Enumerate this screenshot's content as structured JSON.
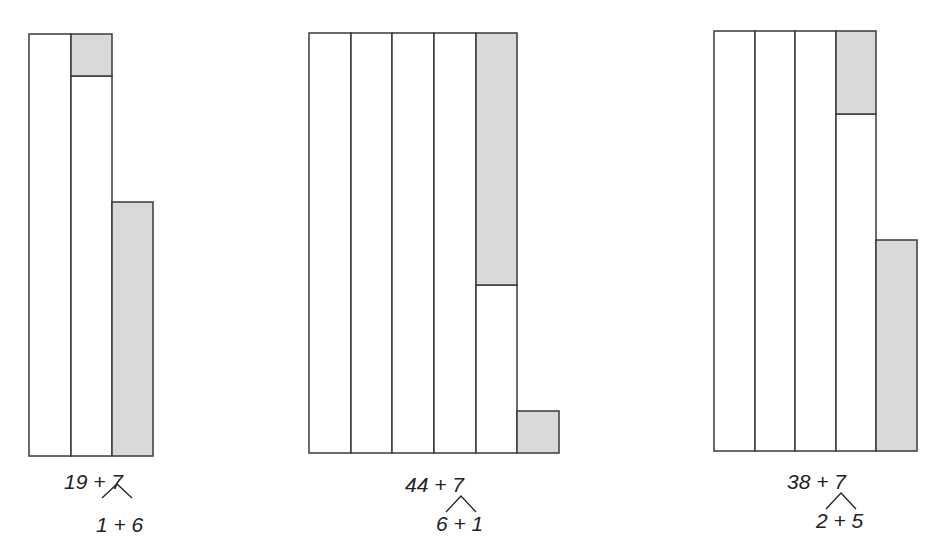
{
  "diagrams": [
    {
      "name": "nineteen-plus-seven",
      "expression": "19 + 7",
      "split": "1 + 6",
      "tens_columns": 1,
      "partial_column_units": 9,
      "added_units": 7,
      "fill_units": 1,
      "leftover_units": 6
    },
    {
      "name": "forty-four-plus-seven",
      "expression": "44 + 7",
      "split": "6 + 1",
      "tens_columns": 4,
      "partial_column_units": 4,
      "added_units": 7,
      "fill_units": 6,
      "leftover_units": 1
    },
    {
      "name": "thirty-eight-plus-seven",
      "expression": "38 + 7",
      "split": "2 + 5",
      "tens_columns": 3,
      "partial_column_units": 8,
      "added_units": 7,
      "fill_units": 2,
      "leftover_units": 5
    }
  ],
  "colors": {
    "shade": "#d9d9d9",
    "stroke": "#3a3a3a"
  }
}
